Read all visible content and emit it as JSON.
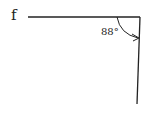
{
  "diagram": {
    "line_label": "f",
    "angle_label": "88°",
    "angle_value_degrees": 88,
    "stroke_color": "#222222",
    "background_color": "#ffffff"
  }
}
